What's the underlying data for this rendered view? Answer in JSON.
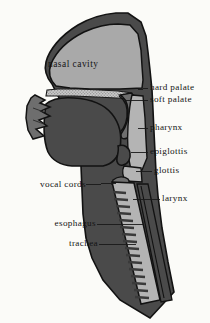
{
  "figure": {
    "type": "anatomical-diagram",
    "background_color": "#fbfbf8",
    "colors": {
      "tissue_dark": "#4a4a4a",
      "tissue_mid": "#6e6e6e",
      "cavity_light": "#a9a9a9",
      "airway_light": "#b4b4b4",
      "hard_palate_stipple": "#c3c3c3",
      "outline": "#121212",
      "label_text": "#141414",
      "leader_line": "#1a1a1a"
    }
  },
  "labels": {
    "nasal_cavity": "nasal cavity",
    "hard_palate": "hard palate",
    "soft_palate": "soft  palate",
    "pharynx": "pharynx",
    "epiglottis": "epiglottis",
    "glottis": "glottis",
    "vocal_cords": "vocal  cords",
    "larynx": "larynx",
    "esophagus": "esophagus",
    "trachea": "trachea"
  },
  "label_positions": {
    "nasal_cavity": {
      "x": 48,
      "y": 66,
      "side": "inside"
    },
    "hard_palate": {
      "x": 150,
      "y": 88,
      "side": "right"
    },
    "soft_palate": {
      "x": 150,
      "y": 100,
      "side": "right"
    },
    "pharynx": {
      "x": 150,
      "y": 128,
      "side": "right"
    },
    "epiglottis": {
      "x": 150,
      "y": 152,
      "side": "right"
    },
    "glottis": {
      "x": 154,
      "y": 171,
      "side": "right"
    },
    "larynx": {
      "x": 162,
      "y": 199,
      "side": "right"
    },
    "vocal_cords": {
      "x": 38,
      "y": 185,
      "side": "left"
    },
    "esophagus": {
      "x": 48,
      "y": 224,
      "side": "left"
    },
    "trachea": {
      "x": 62,
      "y": 244,
      "side": "left"
    }
  },
  "structures": [
    {
      "name": "nasal-cavity",
      "fill": "cavity_light"
    },
    {
      "name": "hard-palate",
      "fill": "hard_palate_stipple"
    },
    {
      "name": "soft-palate",
      "fill": "tissue_mid"
    },
    {
      "name": "tongue",
      "fill": "tissue_dark"
    },
    {
      "name": "lips-and-teeth",
      "fill": "tissue_mid"
    },
    {
      "name": "pharynx-airway",
      "fill": "airway_light"
    },
    {
      "name": "epiglottis",
      "fill": "tissue_dark"
    },
    {
      "name": "glottis",
      "fill": "airway_light"
    },
    {
      "name": "vocal-cords",
      "fill": "tissue_mid"
    },
    {
      "name": "larynx",
      "fill": "airway_light"
    },
    {
      "name": "trachea",
      "fill": "airway_light",
      "detail": "cartilage-rings"
    },
    {
      "name": "esophagus",
      "fill": "tissue_dark"
    },
    {
      "name": "head-and-neck-outline",
      "fill": "tissue_dark"
    }
  ],
  "trachea_rings": {
    "count": 16,
    "description": "horizontal cartilage ring dashes along the anterior tracheal wall"
  }
}
